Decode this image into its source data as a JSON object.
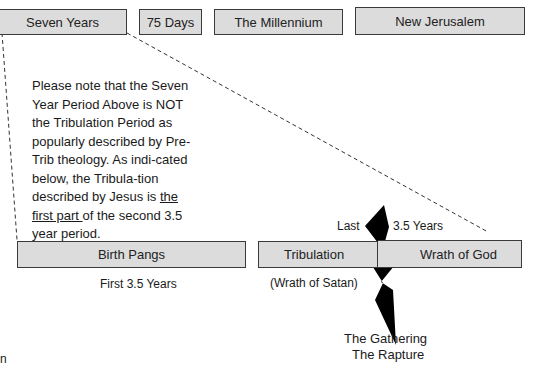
{
  "top_row": {
    "boxes": [
      {
        "label": "Seven Years"
      },
      {
        "label": "75 Days"
      },
      {
        "label": "The Millennium"
      },
      {
        "label": "New Jerusalem"
      }
    ]
  },
  "note": {
    "before": "Please note that the Seven Year Period Above is NOT the Tribulation Period as popularly described by Pre-Trib theology. As indi-cated below, the Tribula-tion described by Jesus is ",
    "underlined": "the first part ",
    "after": "of the second 3.5 year period."
  },
  "bottom_row": {
    "boxes": [
      {
        "label": "Birth Pangs"
      },
      {
        "label": "Tribulation"
      },
      {
        "label": "Wrath of God"
      }
    ],
    "first_half_caption": "First 3.5 Years",
    "last_label": "Last",
    "years_label": "3.5 Years",
    "wrath_of_satan": "(Wrath of Satan)",
    "gathering": "The Gathering",
    "rapture": "The Rapture",
    "corner_fragment": "n"
  },
  "colors": {
    "box_fill": "#dcdcdc",
    "box_border": "#3a3a3a",
    "bolt": "#000000",
    "dash": "#333333"
  }
}
